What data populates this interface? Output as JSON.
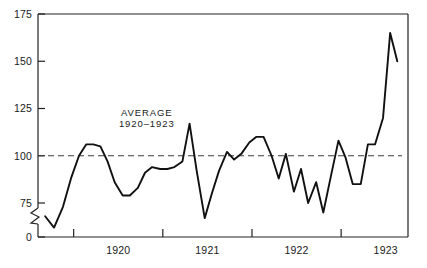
{
  "chart_data": {
    "type": "line",
    "title": "",
    "xlabel": "",
    "ylabel": "",
    "xlim": [
      1919.6,
      1923.75
    ],
    "ylim": [
      0,
      175
    ],
    "grid": false,
    "legend": null,
    "y_axis_break": true,
    "y_break_between": [
      0,
      75
    ],
    "yticks": [
      0,
      75,
      100,
      125,
      150,
      175
    ],
    "ytick_labels": [
      "0",
      "75",
      "100",
      "125",
      "150",
      "175"
    ],
    "xticks": [
      1920,
      1921,
      1922,
      1923,
      1924
    ],
    "xtick_labels": [
      "1920",
      "1921",
      "1922",
      "1923"
    ],
    "annotations": [
      {
        "name": "average-label",
        "line1": "AVERAGE",
        "line2": "1920–1923",
        "x": 1920.82,
        "y": 121
      }
    ],
    "reference_line": {
      "name": "average-1920-1923",
      "value": 100,
      "style": "dashed",
      "color": "#3d3d3d"
    },
    "series": [
      {
        "name": "index",
        "color": "#111111",
        "x": [
          1919.68,
          1919.78,
          1919.88,
          1919.97,
          1920.06,
          1920.14,
          1920.22,
          1920.3,
          1920.38,
          1920.46,
          1920.55,
          1920.63,
          1920.72,
          1920.8,
          1920.88,
          1920.97,
          1921.05,
          1921.13,
          1921.22,
          1921.3,
          1921.38,
          1921.47,
          1921.55,
          1921.63,
          1921.72,
          1921.8,
          1921.88,
          1921.97,
          1922.05,
          1922.13,
          1922.22,
          1922.3,
          1922.38,
          1922.47,
          1922.55,
          1922.63,
          1922.72,
          1922.8,
          1922.88,
          1922.97,
          1923.05,
          1923.13,
          1923.22,
          1923.3,
          1923.38,
          1923.47,
          1923.55,
          1923.63
        ],
        "values": [
          68,
          62,
          73,
          88,
          100,
          106,
          106,
          105,
          97,
          86,
          79,
          79,
          83,
          91,
          94,
          93,
          93,
          94,
          97,
          117,
          92,
          67,
          80,
          92,
          102,
          98,
          101,
          107,
          110,
          110,
          100,
          88,
          101,
          81,
          93,
          75,
          86,
          70,
          88,
          108,
          99,
          85,
          85,
          106,
          106,
          120,
          165,
          150
        ]
      }
    ]
  }
}
